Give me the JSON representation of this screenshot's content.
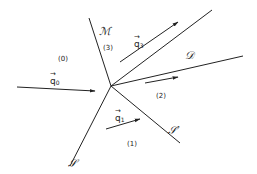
{
  "diagram": {
    "type": "shock wave interaction (Mach reflection) diagram",
    "regions": [
      {
        "id": "region-0",
        "label": "(0)"
      },
      {
        "id": "region-1",
        "label": "(1)"
      },
      {
        "id": "region-2",
        "label": "(2)"
      },
      {
        "id": "region-3",
        "label": "(3)"
      }
    ],
    "lines": {
      "mach_stem": "ℳ",
      "incident_shock": "ℐ",
      "reflected_shock": "ℐ′",
      "slip_line": "ᵉF"
    },
    "line_labels": {
      "M": "ℳ",
      "S": "𝒮",
      "S_prime": "𝒮′",
      "D": "𝒟"
    },
    "velocities": {
      "q0": {
        "symbol": "q",
        "sub": "0",
        "arrow": "→"
      },
      "q1": {
        "symbol": "q",
        "sub": "1",
        "arrow": "→"
      },
      "q3": {
        "symbol": "q",
        "sub": "3",
        "arrow": "→"
      }
    },
    "color": "#222222"
  }
}
